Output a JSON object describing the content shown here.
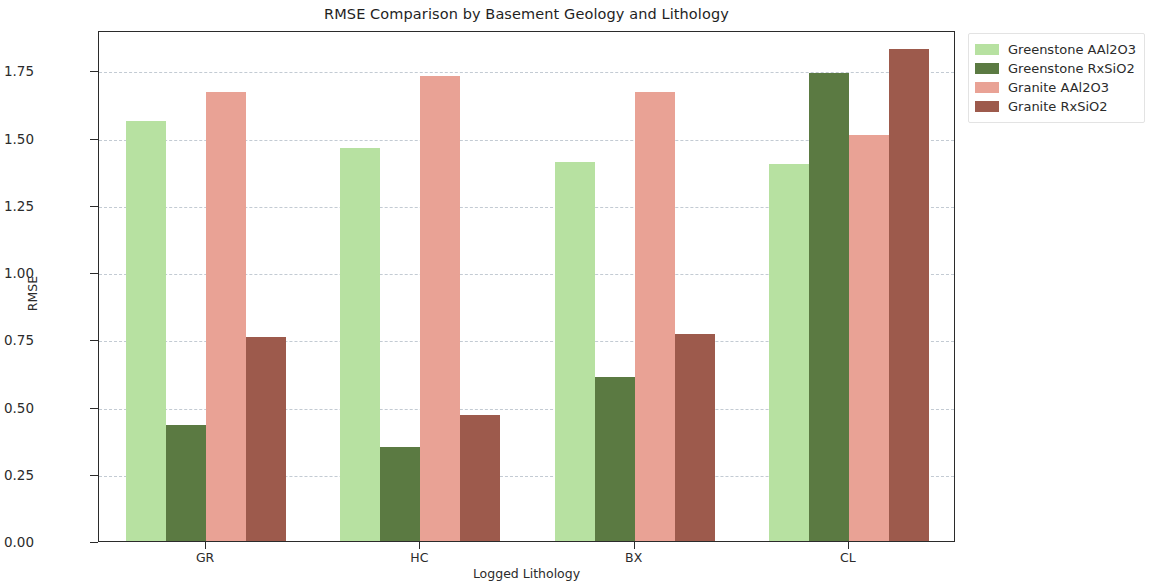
{
  "chart_data": {
    "type": "bar",
    "title": "RMSE Comparison by Basement Geology and Lithology",
    "xlabel": "Logged Lithology",
    "ylabel": "RMSE",
    "categories": [
      "GR",
      "HC",
      "BX",
      "CL"
    ],
    "ylim": [
      0.0,
      1.9
    ],
    "yticks": [
      "0.00",
      "0.25",
      "0.50",
      "0.75",
      "1.00",
      "1.25",
      "1.50",
      "1.75"
    ],
    "ytick_values": [
      0.0,
      0.25,
      0.5,
      0.75,
      1.0,
      1.25,
      1.5,
      1.75
    ],
    "grid": true,
    "legend_position": "upper right outside",
    "series": [
      {
        "name": "Greenstone AAl2O3",
        "color": "#b7e1a1",
        "values": [
          1.56,
          1.46,
          1.41,
          1.4
        ]
      },
      {
        "name": "Greenstone RxSiO2",
        "color": "#5b7a42",
        "values": [
          0.43,
          0.35,
          0.61,
          1.74
        ]
      },
      {
        "name": "Granite AAl2O3",
        "color": "#e9a295",
        "values": [
          1.67,
          1.73,
          1.67,
          1.51
        ]
      },
      {
        "name": "Granite RxSiO2",
        "color": "#9d5a4c",
        "values": [
          0.76,
          0.47,
          0.77,
          1.83
        ]
      }
    ]
  },
  "legend": {
    "items": [
      {
        "label": "Greenstone AAl2O3",
        "color": "#b7e1a1"
      },
      {
        "label": "Greenstone RxSiO2",
        "color": "#5b7a42"
      },
      {
        "label": "Granite AAl2O3",
        "color": "#e9a295"
      },
      {
        "label": "Granite RxSiO2",
        "color": "#9d5a4c"
      }
    ]
  },
  "colors": {
    "axis": "#2b2b2b",
    "grid": "#b9c2cc",
    "background": "#ffffff",
    "text": "#262626"
  }
}
